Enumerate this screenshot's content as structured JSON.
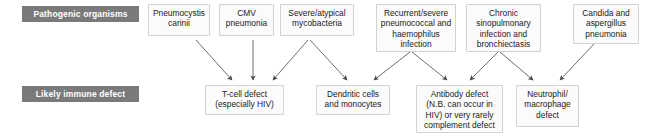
{
  "diagram": {
    "type": "flowchart",
    "row_labels": {
      "pathogens": "Pathogenic organisms",
      "immune": "Likely immune defect"
    },
    "colors": {
      "label_background": "#7a7a7a",
      "label_text": "#ffffff",
      "node_background": "#fbfbfb",
      "node_border": "#d2d2d2",
      "connector": "#6e6e6e",
      "page_background": "#ffffff"
    },
    "pathogens": [
      {
        "id": "pneumocystis",
        "label": "Pneumocystis carinii"
      },
      {
        "id": "cmv",
        "label": "CMV pneumonia"
      },
      {
        "id": "mycobacteria",
        "label": "Severe/atypical mycobacteria"
      },
      {
        "id": "pneumococcal",
        "label": "Recurrent/severe pneumococcal and haemophilus infection"
      },
      {
        "id": "sinopulmonary",
        "label": "Chronic sinopulmonary infection and bronchiectasis"
      },
      {
        "id": "candida",
        "label": "Candida and aspergillus pneumonia"
      }
    ],
    "defects": [
      {
        "id": "tcell",
        "label": "T-cell defect (especially HIV)"
      },
      {
        "id": "dendritic",
        "label": "Dendritic cells and monocytes"
      },
      {
        "id": "antibody",
        "label": "Antibody defect (N.B. can occur in HIV) or very rarely complement defect"
      },
      {
        "id": "neutrophil",
        "label": "Neutrophil/ macrophage defect"
      }
    ],
    "connections": [
      {
        "from": "pneumocystis",
        "to": "tcell"
      },
      {
        "from": "cmv",
        "to": "tcell"
      },
      {
        "from": "mycobacteria",
        "to": "tcell"
      },
      {
        "from": "mycobacteria",
        "to": "dendritic"
      },
      {
        "from": "pneumococcal",
        "to": "dendritic"
      },
      {
        "from": "pneumococcal",
        "to": "antibody"
      },
      {
        "from": "sinopulmonary",
        "to": "antibody"
      },
      {
        "from": "sinopulmonary",
        "to": "neutrophil"
      },
      {
        "from": "candida",
        "to": "neutrophil"
      }
    ]
  }
}
